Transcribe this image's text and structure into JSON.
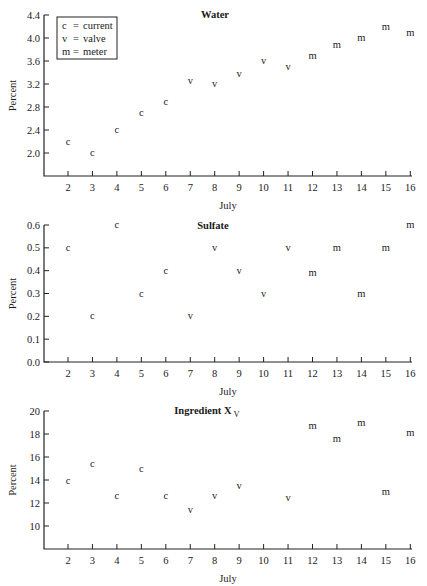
{
  "legend": {
    "items": [
      {
        "symbol": "c",
        "label": "current"
      },
      {
        "symbol": "v",
        "label": "valve"
      },
      {
        "symbol": "m",
        "label": "meter"
      }
    ]
  },
  "chart_data": [
    {
      "type": "scatter",
      "title": "Water",
      "title_subscript": "",
      "xlabel": "July",
      "ylabel": "Percent",
      "x_ticks": [
        2,
        3,
        4,
        5,
        6,
        7,
        8,
        9,
        10,
        11,
        12,
        13,
        14,
        15,
        16
      ],
      "y_ticks": [
        2.0,
        2.4,
        2.8,
        3.2,
        3.6,
        4.0,
        4.4
      ],
      "y_tick_labels": [
        "2.0",
        "2.4",
        "2.8",
        "3.2",
        "3.6",
        "4.0",
        "4.4"
      ],
      "ylim": [
        1.6,
        4.4
      ],
      "xlim": [
        1,
        16
      ],
      "legend_position": "upper left",
      "points": [
        {
          "x": 2,
          "y": 2.2,
          "marker": "c"
        },
        {
          "x": 3,
          "y": 2.0,
          "marker": "c"
        },
        {
          "x": 4,
          "y": 2.4,
          "marker": "c"
        },
        {
          "x": 5,
          "y": 2.7,
          "marker": "c"
        },
        {
          "x": 6,
          "y": 2.88,
          "marker": "c"
        },
        {
          "x": 7,
          "y": 3.25,
          "marker": "v"
        },
        {
          "x": 8,
          "y": 3.2,
          "marker": "v"
        },
        {
          "x": 9,
          "y": 3.37,
          "marker": "v"
        },
        {
          "x": 10,
          "y": 3.6,
          "marker": "v"
        },
        {
          "x": 11,
          "y": 3.5,
          "marker": "v"
        },
        {
          "x": 12,
          "y": 3.68,
          "marker": "m"
        },
        {
          "x": 13,
          "y": 3.88,
          "marker": "m"
        },
        {
          "x": 14,
          "y": 4.0,
          "marker": "m"
        },
        {
          "x": 15,
          "y": 4.2,
          "marker": "m"
        },
        {
          "x": 16,
          "y": 4.08,
          "marker": "m"
        }
      ]
    },
    {
      "type": "scatter",
      "title": "Sulfate",
      "title_subscript": "",
      "xlabel": "July",
      "ylabel": "Percent",
      "x_ticks": [
        2,
        3,
        4,
        5,
        6,
        7,
        8,
        9,
        10,
        11,
        12,
        13,
        14,
        15,
        16
      ],
      "y_ticks": [
        0.0,
        0.1,
        0.2,
        0.3,
        0.4,
        0.5,
        0.6
      ],
      "y_tick_labels": [
        "0.0",
        "0.1",
        "0.2",
        "0.3",
        "0.4",
        "0.5",
        "0.6"
      ],
      "ylim": [
        0.0,
        0.6
      ],
      "xlim": [
        1,
        16
      ],
      "points": [
        {
          "x": 2,
          "y": 0.5,
          "marker": "c"
        },
        {
          "x": 3,
          "y": 0.2,
          "marker": "c"
        },
        {
          "x": 4,
          "y": 0.6,
          "marker": "c"
        },
        {
          "x": 5,
          "y": 0.3,
          "marker": "c"
        },
        {
          "x": 6,
          "y": 0.4,
          "marker": "c"
        },
        {
          "x": 7,
          "y": 0.2,
          "marker": "v"
        },
        {
          "x": 8,
          "y": 0.5,
          "marker": "v"
        },
        {
          "x": 9,
          "y": 0.4,
          "marker": "v"
        },
        {
          "x": 10,
          "y": 0.3,
          "marker": "v"
        },
        {
          "x": 11,
          "y": 0.5,
          "marker": "v"
        },
        {
          "x": 12,
          "y": 0.39,
          "marker": "m"
        },
        {
          "x": 13,
          "y": 0.5,
          "marker": "m"
        },
        {
          "x": 14,
          "y": 0.3,
          "marker": "m"
        },
        {
          "x": 15,
          "y": 0.5,
          "marker": "m"
        },
        {
          "x": 16,
          "y": 0.6,
          "marker": "m"
        }
      ]
    },
    {
      "type": "scatter",
      "title": "Ingredient X",
      "title_subscript": "V",
      "xlabel": "July",
      "ylabel": "Percent",
      "x_ticks": [
        2,
        3,
        4,
        5,
        6,
        7,
        8,
        9,
        10,
        11,
        12,
        13,
        14,
        15,
        16
      ],
      "y_ticks": [
        10,
        12,
        14,
        16,
        18,
        20
      ],
      "y_tick_labels": [
        "10",
        "12",
        "14",
        "16",
        "18",
        "20"
      ],
      "ylim": [
        8,
        20
      ],
      "xlim": [
        1,
        16
      ],
      "points": [
        {
          "x": 2,
          "y": 13.9,
          "marker": "c"
        },
        {
          "x": 3,
          "y": 15.4,
          "marker": "c"
        },
        {
          "x": 4,
          "y": 12.6,
          "marker": "c"
        },
        {
          "x": 5,
          "y": 15.0,
          "marker": "c"
        },
        {
          "x": 6,
          "y": 12.6,
          "marker": "c"
        },
        {
          "x": 7,
          "y": 11.4,
          "marker": "v"
        },
        {
          "x": 8,
          "y": 12.6,
          "marker": "v"
        },
        {
          "x": 9,
          "y": 13.5,
          "marker": "v"
        },
        {
          "x": 11,
          "y": 12.4,
          "marker": "v"
        },
        {
          "x": 12,
          "y": 18.7,
          "marker": "m"
        },
        {
          "x": 13,
          "y": 17.6,
          "marker": "m"
        },
        {
          "x": 14,
          "y": 19.0,
          "marker": "m"
        },
        {
          "x": 15,
          "y": 13.0,
          "marker": "m"
        },
        {
          "x": 16,
          "y": 18.1,
          "marker": "m"
        }
      ]
    }
  ]
}
